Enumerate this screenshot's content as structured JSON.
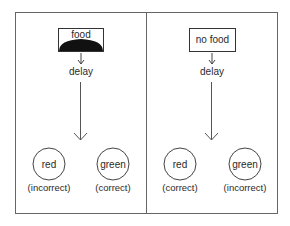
{
  "panels": [
    {
      "stimulus": "food",
      "stimulus_filled_bottom": true,
      "delay_label": "delay",
      "choices": [
        {
          "color_label": "red",
          "outcome": "(incorrect)"
        },
        {
          "color_label": "green",
          "outcome": "(correct)"
        }
      ]
    },
    {
      "stimulus": "no food",
      "stimulus_filled_bottom": false,
      "delay_label": "delay",
      "choices": [
        {
          "color_label": "red",
          "outcome": "(correct)"
        },
        {
          "color_label": "green",
          "outcome": "(incorrect)"
        }
      ]
    }
  ],
  "colors": {
    "line": "#555555",
    "text": "#2a2a2a",
    "food_fill": "#111111"
  }
}
